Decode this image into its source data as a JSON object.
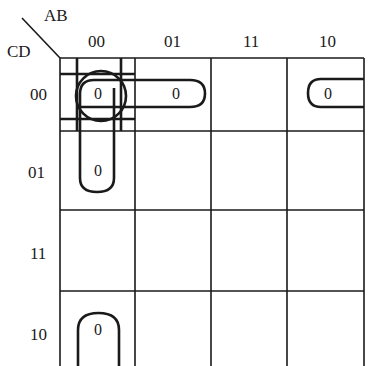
{
  "diagram": {
    "type": "karnaugh-map",
    "row_variable_label": "CD",
    "col_variable_label": "AB",
    "col_headers": [
      "00",
      "01",
      "11",
      "10"
    ],
    "row_headers": [
      "00",
      "01",
      "11",
      "10"
    ],
    "cells": [
      [
        "0",
        "0",
        "",
        "0"
      ],
      [
        "0",
        "",
        "",
        ""
      ],
      [
        "",
        "",
        "",
        ""
      ],
      [
        "0",
        "",
        "",
        ""
      ]
    ],
    "groupings": [
      {
        "name": "single-cell-circle",
        "cells": [
          [
            0,
            0
          ]
        ]
      },
      {
        "name": "row-00-pair",
        "cells": [
          [
            0,
            0
          ],
          [
            0,
            1
          ]
        ]
      },
      {
        "name": "col-00-vertical-pair",
        "cells": [
          [
            0,
            0
          ],
          [
            1,
            0
          ]
        ]
      },
      {
        "name": "col-00-wrap-pair",
        "cells": [
          [
            3,
            0
          ],
          [
            0,
            0
          ]
        ]
      },
      {
        "name": "row-00-wrap-pair",
        "cells": [
          [
            0,
            3
          ],
          [
            0,
            0
          ]
        ]
      }
    ],
    "line_color": "#1a1a1a"
  }
}
